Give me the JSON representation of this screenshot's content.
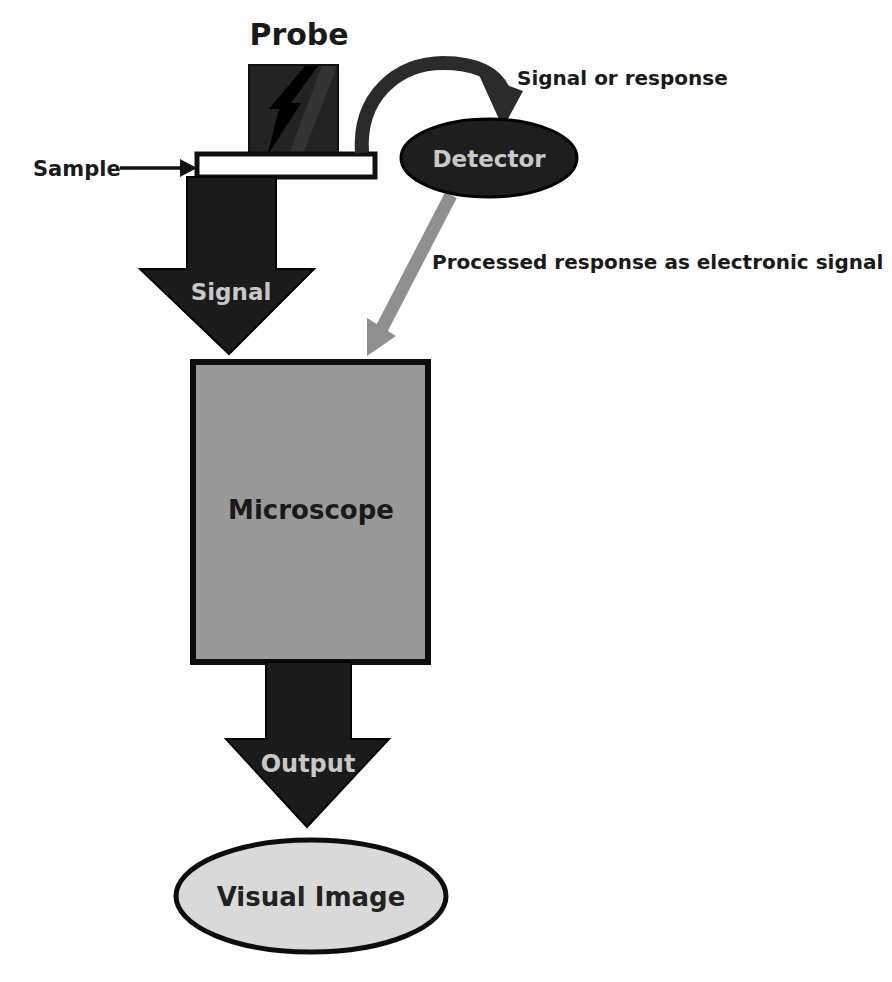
{
  "diagram": {
    "type": "flowchart",
    "nodes": {
      "probe": {
        "label": "Probe",
        "shape": "dark-square-with-lightning-bolt"
      },
      "sample": {
        "label": "Sample",
        "shape": "white-slide-bar"
      },
      "detector": {
        "label": "Detector",
        "shape": "dark-ellipse"
      },
      "microscope": {
        "label": "Microscope",
        "shape": "gray-rectangle"
      },
      "visual_image": {
        "label": "Visual Image",
        "shape": "light-ellipse"
      }
    },
    "edges": {
      "signal": {
        "label": "Signal",
        "from": "sample",
        "to": "microscope",
        "style": "block-arrow-dark-down"
      },
      "signal_or_response": {
        "label": "Signal or response",
        "from": "probe",
        "to": "detector",
        "style": "curved-arrow-dark"
      },
      "processed_response": {
        "label": "Processed response as electronic signal",
        "from": "detector",
        "to": "microscope",
        "style": "straight-arrow-gray"
      },
      "output": {
        "label": "Output",
        "from": "microscope",
        "to": "visual_image",
        "style": "block-arrow-dark-down"
      }
    },
    "colors": {
      "background": "#ffffff",
      "dark_shape": "#1b1b1b",
      "probe_block": "#232323",
      "bolt": "#000000",
      "microscope_fill": "#999999",
      "visual_image_fill": "#d9d9d9",
      "detector_fill": "#1e1e1e",
      "gray_arrow": "#8f8f8f",
      "arc_arrow": "#2b2b2b",
      "light_text": "#c8c8c8",
      "dark_text": "#1a1a1a"
    }
  }
}
